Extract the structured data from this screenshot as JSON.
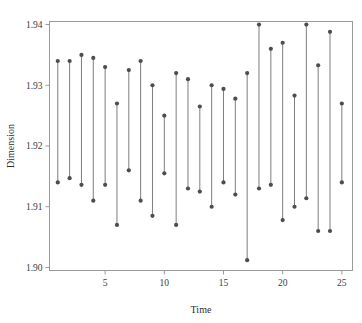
{
  "chart_data": {
    "type": "line",
    "title": "",
    "subtitle": "",
    "xlabel": "Time",
    "ylabel": "Dimension",
    "xlim": [
      0.3,
      25.9
    ],
    "ylim": [
      1.8995,
      1.9405
    ],
    "xticks": [
      5,
      10,
      15,
      20,
      25
    ],
    "xticklabels": [
      "5",
      "10",
      "15",
      "20",
      "25"
    ],
    "yticks": [
      1.9,
      1.91,
      1.92,
      1.93,
      1.94
    ],
    "yticklabels": [
      "1.90",
      "1.91",
      "1.92",
      "1.93",
      "1.94"
    ],
    "grid": false,
    "legend": null,
    "marker": "filled-circle",
    "marker_color": "#4d4d4d",
    "line_color": "#6e6e6e",
    "frame": true,
    "x": [
      1,
      2,
      3,
      4,
      5,
      6,
      7,
      8,
      9,
      10,
      11,
      12,
      13,
      14,
      15,
      16,
      17,
      18,
      19,
      20,
      21,
      22,
      23,
      24,
      25
    ],
    "series": [
      {
        "name": "Upper",
        "values": [
          1.934,
          1.934,
          1.935,
          1.9345,
          1.933,
          1.927,
          1.9325,
          1.934,
          1.93,
          1.925,
          1.932,
          1.931,
          1.9265,
          1.93,
          1.9294,
          1.9278,
          1.932,
          1.94,
          1.936,
          1.937,
          1.9283,
          1.94,
          1.9333,
          1.9388,
          1.927
        ]
      },
      {
        "name": "Lower",
        "values": [
          1.914,
          1.9147,
          1.9136,
          1.911,
          1.9136,
          1.907,
          1.916,
          1.911,
          1.9085,
          1.9155,
          1.907,
          1.913,
          1.9125,
          1.91,
          1.914,
          1.912,
          1.9012,
          1.913,
          1.9136,
          1.9078,
          1.91,
          1.9114,
          1.906,
          1.906,
          1.914
        ]
      }
    ]
  },
  "axes": {
    "y_label_text": "Dimension",
    "x_label_text": "Time"
  }
}
